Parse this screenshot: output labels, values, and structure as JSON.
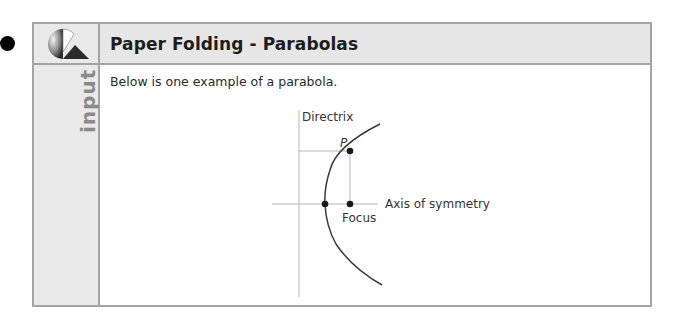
{
  "panel": {
    "title": "Paper Folding - Parabolas",
    "side_label": "input",
    "intro_text": "Below is one example of a parabola."
  },
  "diagram": {
    "labels": {
      "directrix": "Directrix",
      "point": "P",
      "focus": "Focus",
      "axis": "Axis of symmetry"
    },
    "colors": {
      "curve": "#3a3a3a",
      "guide": "#b5b5b5",
      "dot": "#1a1a1a"
    }
  }
}
